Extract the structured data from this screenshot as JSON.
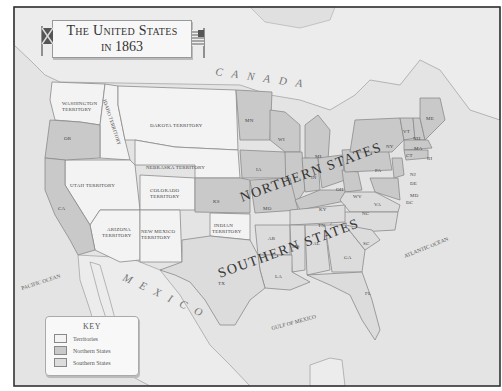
{
  "title": {
    "line1": "The United States",
    "line2": "in 1863"
  },
  "key": {
    "title": "KEY",
    "items": [
      {
        "label": "Territories",
        "color": "#f3f3f3"
      },
      {
        "label": "Northern States",
        "color": "#c9c9c9"
      },
      {
        "label": "Southern States",
        "color": "#dcdcdc"
      }
    ]
  },
  "regions": {
    "northern_label": "NORTHERN STATES",
    "southern_label": "SOUTHERN STATES"
  },
  "countries": {
    "canada": "CANADA",
    "mexico": "MEXICO"
  },
  "water": {
    "pacific": "PACIFIC OCEAN",
    "atlantic": "ATLANTIC OCEAN",
    "gulf": "GULF OF MEXICO"
  },
  "territories": {
    "washington": [
      "WASHINGTON",
      "TERRITORY"
    ],
    "idaho": "IDAHO TERRITORY",
    "dakota": "DAKOTA TERRITORY",
    "nebraska": "NEBRASKA TERRITORY",
    "utah": "UTAH TERRITORY",
    "colorado": [
      "COLORADO",
      "TERRITORY"
    ],
    "arizona": [
      "ARIZONA",
      "TERRITORY"
    ],
    "new_mexico": [
      "NEW MEXICO",
      "TERRITORY"
    ],
    "indian": [
      "INDIAN",
      "TERRITORY"
    ]
  },
  "states": {
    "OR": "OR",
    "CA": "CA",
    "KS": "KS",
    "MN": "MN",
    "WI": "WI",
    "IA": "IA",
    "IL": "IL",
    "MI": "MI",
    "IN": "IN",
    "OH": "OH",
    "MO": "MO",
    "KY": "KY",
    "WV": "WV",
    "PA": "PA",
    "NY": "NY",
    "VT": "VT",
    "NH": "NH",
    "ME": "ME",
    "MA": "MA",
    "CT": "CT",
    "RI": "RI",
    "NJ": "NJ",
    "DE": "DE",
    "MD": "MD",
    "DC": "DC",
    "VA": "VA",
    "NC": "NC",
    "TN": "TN",
    "AR": "AR",
    "SC": "SC",
    "GA": "GA",
    "AL": "AL",
    "MS": "MS",
    "LA": "LA",
    "TX": "TX",
    "FL": "FL"
  },
  "colors": {
    "territories": "#f3f3f3",
    "northern": "#c9c9c9",
    "southern": "#dcdcdc",
    "water": "#e4e4e4"
  }
}
